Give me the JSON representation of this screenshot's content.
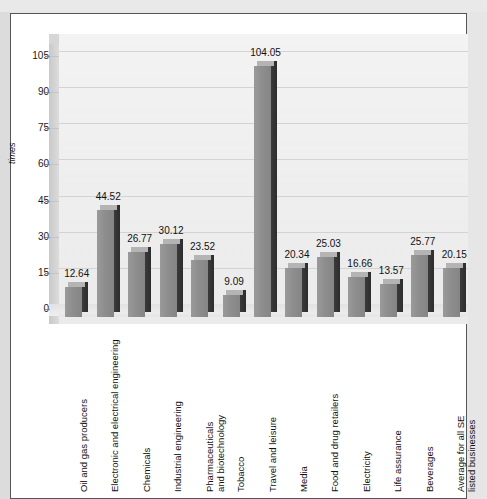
{
  "chart_data": {
    "type": "bar",
    "title": "",
    "subtitle": "",
    "xlabel": "",
    "ylabel": "times",
    "ylim": [
      0,
      112
    ],
    "grid": true,
    "legend": "none",
    "yticks": [
      0,
      15,
      30,
      45,
      60,
      75,
      90,
      105
    ],
    "ytick_labels": [
      "0",
      "15",
      "30",
      "45",
      "60",
      "75",
      "90",
      "105"
    ],
    "categories": [
      "Oil and gas producers",
      "Electronic and electrical engineering",
      "Chemicals",
      "Industrial engineering",
      "Pharmaceuticals and biotechnology",
      "Tobacco",
      "Travel and leisure",
      "Media",
      "Food and drug retailers",
      "Electricity",
      "Life assurance",
      "Beverages",
      "Average for all SE listed businesses"
    ],
    "category_lines": [
      [
        "Oil and gas producers"
      ],
      [
        "Electronic and electrical engineering"
      ],
      [
        "Chemicals"
      ],
      [
        "Industrial engineering"
      ],
      [
        "Pharmaceuticals",
        "and biotechnology"
      ],
      [
        "Tobacco"
      ],
      [
        "Travel and leisure"
      ],
      [
        "Media"
      ],
      [
        "Food and drug retailers"
      ],
      [
        "Electricity"
      ],
      [
        "Life assurance"
      ],
      [
        "Beverages"
      ],
      [
        "Average for all SE",
        "listed businesses"
      ]
    ],
    "values": [
      12.64,
      44.52,
      26.77,
      30.12,
      23.52,
      9.09,
      104.05,
      20.34,
      25.03,
      16.66,
      13.57,
      25.77,
      20.15
    ],
    "value_labels": [
      "12.64",
      "44.52",
      "26.77",
      "30.12",
      "23.52",
      "9.09",
      "104.05",
      "20.34",
      "25.03",
      "16.66",
      "13.57",
      "25.77",
      "20.15"
    ],
    "colors": {
      "bar_front": "#8e8e8e",
      "bar_side": "#333333",
      "bar_top": "#b4b4b4",
      "back_wall": "#efefef",
      "grid_line": "#d3d3d3",
      "panel": "#ffffff",
      "page_background": "#e6e6e6",
      "text": "#111111"
    }
  }
}
